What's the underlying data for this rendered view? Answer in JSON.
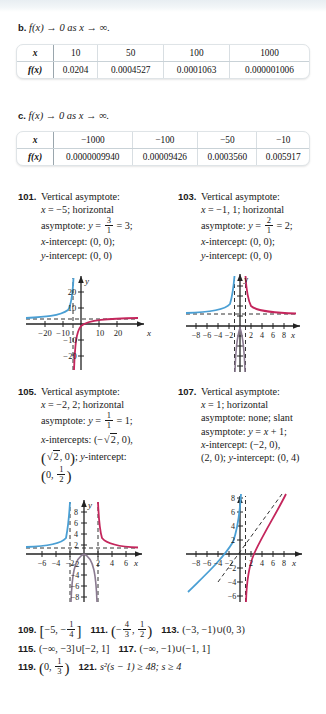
{
  "parts": [
    {
      "id": "b",
      "label": "b.",
      "text": "f(x) → 0 as x → ∞."
    },
    {
      "id": "c",
      "label": "c.",
      "text": "f(x) → 0 as x → ∞."
    }
  ],
  "tables": [
    {
      "name": "table-b",
      "row_header_x": "x",
      "row_header_fx": "f(x)",
      "x_values": [
        "10",
        "50",
        "100",
        "1000"
      ],
      "fx_values": [
        "0.0204",
        "0.0004527",
        "0.0001063",
        "0.000001006"
      ]
    },
    {
      "name": "table-c",
      "row_header_x": "x",
      "row_header_fx": "f(x)",
      "x_values": [
        "−1000",
        "−100",
        "−50",
        "−10"
      ],
      "fx_values": [
        "0.0000009940",
        "0.00009426",
        "0.0003560",
        "0.005917"
      ]
    }
  ],
  "answers": [
    {
      "number": "101.",
      "lines": [
        "Vertical asymptote:",
        "x = −5; horizontal",
        "asymptote: y = 3/1 = 3;",
        "x-intercept: (0, 0);",
        "y-intercept: (0, 0)"
      ],
      "vertical_asymptote": "x = −5",
      "horizontal_asymptote_num": "3",
      "horizontal_asymptote_den": "1",
      "horizontal_asymptote_value": "3",
      "x_intercept": "(0, 0)",
      "y_intercept": "(0, 0)"
    },
    {
      "number": "103.",
      "lines": [
        "Vertical asymptote:",
        "x = −1, 1; horizontal",
        "asymptote: y = 2/1 = 2;",
        "x-intercept: (0, 0);",
        "y-intercept: (0, 0)"
      ],
      "vertical_asymptote": "x = −1, 1",
      "horizontal_asymptote_num": "2",
      "horizontal_asymptote_den": "1",
      "horizontal_asymptote_value": "2",
      "x_intercept": "(0, 0)",
      "y_intercept": "(0, 0)"
    },
    {
      "number": "105.",
      "lines": [
        "Vertical asymptote:",
        "x = −2, 2; horizontal",
        "asymptote: y = 1/1 = 1;",
        "x-intercepts: (−√2, 0), (√2, 0); y-intercept: (0, 1/2)"
      ],
      "vertical_asymptote": "x = −2, 2",
      "horizontal_asymptote_num": "1",
      "horizontal_asymptote_den": "1",
      "horizontal_asymptote_value": "1",
      "x_intercepts": "(−√2, 0), (√2, 0)",
      "y_intercept_num": "1",
      "y_intercept_den": "2"
    },
    {
      "number": "107.",
      "lines": [
        "Vertical asymptote:",
        "x = 1; horizontal",
        "asymptote: none; slant",
        "asymptote: y = x + 1;",
        "x-intercept: (−2, 0),",
        "(2, 0); y-intercept: (0, 4)"
      ],
      "vertical_asymptote": "x = 1",
      "horizontal_asymptote": "none",
      "slant_asymptote": "y = x + 1",
      "x_intercept": "(−2, 0), (2, 0)",
      "y_intercept": "(0, 4)"
    }
  ],
  "labels": {
    "vertical_asymptote": "Vertical asymptote:",
    "horizontal_word": "horizontal",
    "asymptote_word": "asymptote:",
    "slant_word": "slant",
    "none_word": "none;",
    "x_intercept": "x-intercept:",
    "x_intercepts": "x-intercepts:",
    "y_intercept": "y-intercept:",
    "semicolon": ";"
  },
  "graphs": [
    {
      "name": "graph-101",
      "x_ticks": [
        "−20",
        "−10",
        "10",
        "20"
      ],
      "y_ticks": [
        "20",
        "10",
        "−10",
        "−20"
      ],
      "x_axis_label": "x",
      "y_axis_label": "y",
      "curve_left_color": "#4a9fd4",
      "curve_right_color": "#c4265c"
    },
    {
      "name": "graph-103",
      "x_ticks": [
        "−8",
        "−6",
        "−4",
        "−2",
        "2",
        "4",
        "6",
        "8"
      ],
      "y_ticks": [],
      "x_axis_label": "x",
      "y_axis_label": "y",
      "curve_left_color": "#4a9fd4",
      "curve_right_color": "#c4265c"
    },
    {
      "name": "graph-105",
      "x_ticks": [
        "−6",
        "−4",
        "−2",
        "2",
        "4",
        "6"
      ],
      "y_ticks": [
        "8",
        "6",
        "4",
        "2",
        "−2",
        "−4",
        "−6",
        "−8"
      ],
      "x_axis_label": "x",
      "y_axis_label": "y",
      "curve_left_color": "#4a9fd4",
      "curve_right_color": "#c4265c"
    },
    {
      "name": "graph-107",
      "x_ticks": [
        "−8",
        "−6",
        "−4",
        "−2",
        "2",
        "4",
        "6",
        "8"
      ],
      "y_ticks": [
        "8",
        "6",
        "4",
        "2",
        "−2",
        "−4",
        "−6",
        "−8"
      ],
      "x_axis_label": "x",
      "y_axis_label": "y",
      "curve_left_color": "#4a9fd4",
      "curve_right_color": "#c4265c"
    }
  ],
  "bottom_answers": {
    "row1": [
      {
        "number": "109.",
        "text": "[−5, −1/4]",
        "kind": "bracket-frac",
        "a": "−5",
        "num": "1",
        "den": "4",
        "neg": true
      },
      {
        "number": "111.",
        "text": "(−4/3, 1/2)",
        "kind": "paren-frac2",
        "n1": "4",
        "d1": "3",
        "n2": "1",
        "d2": "2"
      },
      {
        "number": "113.",
        "text": "(−3, −1)∪(0, 3)",
        "kind": "plain"
      }
    ],
    "row2": [
      {
        "number": "115.",
        "text": "(−∞, −3]∪[−2, 1]",
        "kind": "plain"
      },
      {
        "number": "117.",
        "text": "(−∞, −1)∪(−1, 1]",
        "kind": "plain"
      }
    ],
    "row3": [
      {
        "number": "119.",
        "text": "(0, 1/3)",
        "kind": "paren-frac1",
        "n1": "1",
        "d1": "3"
      },
      {
        "number": "121.",
        "text": "s²(s − 1) ≥ 48; s ≥ 4",
        "kind": "plain"
      }
    ]
  },
  "colors": {
    "curve_blue": "#4a9fd4",
    "curve_red": "#c4265c",
    "axis": "#222222",
    "dashed": "#333333",
    "table_border": "#dfe4e7",
    "top_band": "#e8eef2"
  }
}
